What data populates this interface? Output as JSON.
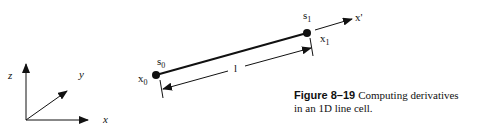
{
  "axes_labels": {
    "z": "z",
    "y": "y",
    "x": "x"
  },
  "points": {
    "start": {
      "s_base": "s",
      "s_sub": "0",
      "x_base": "x",
      "x_sub": "0"
    },
    "end": {
      "s_base": "s",
      "s_sub": "1",
      "x_base": "x",
      "x_sub": "1"
    }
  },
  "local_axis_label": "x'",
  "length_label": "l",
  "caption": {
    "figure_number": "Figure 8–19",
    "text_line1": "Computing derivatives",
    "text_line2": "in an 1D line cell."
  }
}
